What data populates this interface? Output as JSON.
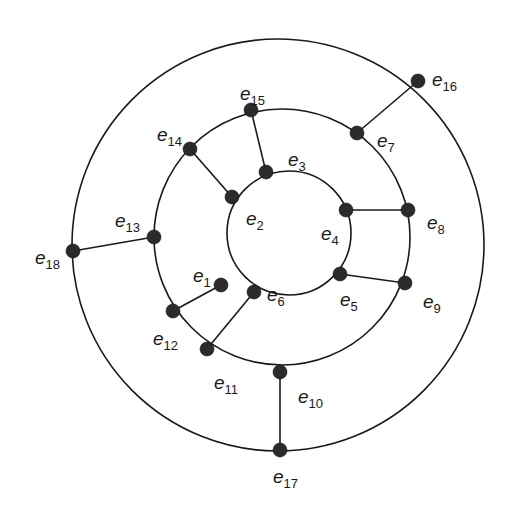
{
  "diagram": {
    "type": "graph",
    "rings": [
      {
        "name": "inner",
        "cx": 289,
        "cy": 233,
        "r": 62
      },
      {
        "name": "middle",
        "cx": 282,
        "cy": 237,
        "r": 128
      },
      {
        "name": "outer",
        "cx": 278,
        "cy": 245,
        "r": 206
      }
    ],
    "nodes": [
      {
        "id": "e1",
        "letter": "e",
        "sub": "1",
        "x": 221,
        "y": 285,
        "lx": 193,
        "ly": 266
      },
      {
        "id": "e2",
        "letter": "e",
        "sub": "2",
        "x": 232,
        "y": 197,
        "lx": 246,
        "ly": 209
      },
      {
        "id": "e3",
        "letter": "e",
        "sub": "3",
        "x": 266,
        "y": 172,
        "lx": 288,
        "ly": 150
      },
      {
        "id": "e4",
        "letter": "e",
        "sub": "4",
        "x": 346,
        "y": 210,
        "lx": 321,
        "ly": 224
      },
      {
        "id": "e5",
        "letter": "e",
        "sub": "5",
        "x": 340,
        "y": 274,
        "lx": 340,
        "ly": 290
      },
      {
        "id": "e6",
        "letter": "e",
        "sub": "6",
        "x": 254,
        "y": 292,
        "lx": 267,
        "ly": 285
      },
      {
        "id": "e7",
        "letter": "e",
        "sub": "7",
        "x": 357,
        "y": 133,
        "lx": 377,
        "ly": 131
      },
      {
        "id": "e8",
        "letter": "e",
        "sub": "8",
        "x": 408,
        "y": 210,
        "lx": 427,
        "ly": 213
      },
      {
        "id": "e9",
        "letter": "e",
        "sub": "9",
        "x": 405,
        "y": 283,
        "lx": 423,
        "ly": 292
      },
      {
        "id": "e10",
        "letter": "e",
        "sub": "10",
        "x": 280,
        "y": 372,
        "lx": 298,
        "ly": 387
      },
      {
        "id": "e11",
        "letter": "e",
        "sub": "11",
        "x": 207,
        "y": 349,
        "lx": 214,
        "ly": 373
      },
      {
        "id": "e12",
        "letter": "e",
        "sub": "12",
        "x": 173,
        "y": 311,
        "lx": 153,
        "ly": 329
      },
      {
        "id": "e13",
        "letter": "e",
        "sub": "13",
        "x": 154,
        "y": 237,
        "lx": 115,
        "ly": 211
      },
      {
        "id": "e14",
        "letter": "e",
        "sub": "14",
        "x": 190,
        "y": 149,
        "lx": 157,
        "ly": 125
      },
      {
        "id": "e15",
        "letter": "e",
        "sub": "15",
        "x": 251,
        "y": 110,
        "lx": 240,
        "ly": 84
      },
      {
        "id": "e16",
        "letter": "e",
        "sub": "16",
        "x": 418,
        "y": 81,
        "lx": 432,
        "ly": 70
      },
      {
        "id": "e17",
        "letter": "e",
        "sub": "17",
        "x": 280,
        "y": 450,
        "lx": 273,
        "ly": 467
      },
      {
        "id": "e18",
        "letter": "e",
        "sub": "18",
        "x": 73,
        "y": 251,
        "lx": 35,
        "ly": 248
      }
    ],
    "edges": [
      [
        "e2",
        "e14"
      ],
      [
        "e3",
        "e15"
      ],
      [
        "e4",
        "e8"
      ],
      [
        "e5",
        "e9"
      ],
      [
        "e1",
        "e12"
      ],
      [
        "e6",
        "e11"
      ],
      [
        "e13",
        "e18"
      ],
      [
        "e10",
        "e17"
      ],
      [
        "e7",
        "e16"
      ]
    ],
    "colors": {
      "line": "#1a1a1a",
      "node": "#2b2b2b",
      "background": "#ffffff"
    }
  }
}
